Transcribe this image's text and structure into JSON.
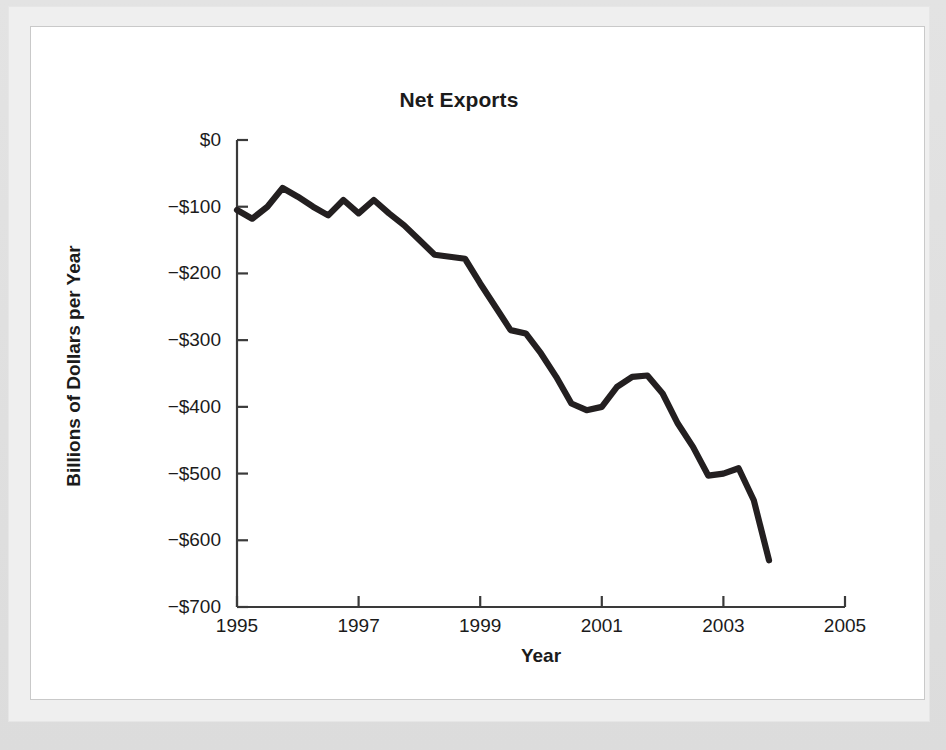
{
  "figure": {
    "title": "Net Exports",
    "background_color": "#ffffff",
    "line_color": "#231f20",
    "axis_color": "#3a3a3a"
  },
  "chart_data": {
    "type": "line",
    "title": "Net Exports",
    "xlabel": "Year",
    "ylabel": "Billions of Dollars per Year",
    "xlim": [
      1995,
      2005
    ],
    "ylim": [
      -700,
      0
    ],
    "grid": false,
    "legend": null,
    "xticks": [
      "1995",
      "1997",
      "1999",
      "2001",
      "2003",
      "2005"
    ],
    "xtick_values": [
      1995,
      1997,
      1999,
      2001,
      2003,
      2005
    ],
    "yticks": [
      "$0",
      "−$100",
      "−$200",
      "−$300",
      "−$400",
      "−$500",
      "−$600",
      "−$700"
    ],
    "ytick_values": [
      0,
      -100,
      -200,
      -300,
      -400,
      -500,
      -600,
      -700
    ],
    "series": [
      {
        "name": "Net Exports",
        "x": [
          1995.0,
          1995.25,
          1995.5,
          1995.75,
          1996.0,
          1996.25,
          1996.5,
          1996.75,
          1997.0,
          1997.25,
          1997.5,
          1997.75,
          1998.0,
          1998.25,
          1998.5,
          1998.75,
          1999.0,
          1999.25,
          1999.5,
          1999.75,
          2000.0,
          2000.25,
          2000.5,
          2000.75,
          2001.0,
          2001.25,
          2001.5,
          2001.75,
          2002.0,
          2002.25,
          2002.5,
          2002.75,
          2003.0,
          2003.25,
          2003.5,
          2003.75
        ],
        "values": [
          -105,
          -118,
          -100,
          -72,
          -85,
          -100,
          -113,
          -90,
          -110,
          -90,
          -110,
          -128,
          -150,
          -172,
          -175,
          -178,
          -215,
          -250,
          -285,
          -290,
          -320,
          -355,
          -395,
          -405,
          -400,
          -370,
          -355,
          -353,
          -380,
          -425,
          -460,
          -503,
          -500,
          -492,
          -540,
          -630
        ]
      }
    ]
  }
}
